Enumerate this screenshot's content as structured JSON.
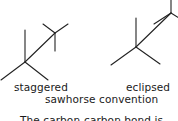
{
  "diagram": {
    "title": "sawhorse convention",
    "conformers": [
      {
        "name": "staggered",
        "label": "staggered"
      },
      {
        "name": "eclipsed",
        "label": "eclipsed"
      }
    ],
    "caption": "sawhorse convention",
    "truncated_text": "The carbon-carbon bond is..."
  }
}
